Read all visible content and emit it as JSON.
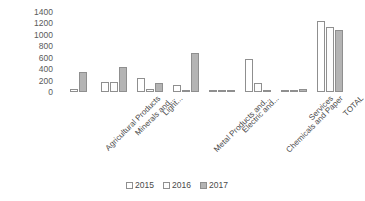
{
  "chart_data": {
    "type": "bar",
    "title": "",
    "subtitle": "",
    "xlabel": "",
    "ylabel": "",
    "ylim": [
      0,
      1400
    ],
    "ytick_step": 200,
    "yticks": [
      "1400",
      "1200",
      "1000",
      "800",
      "600",
      "400",
      "200",
      "0"
    ],
    "grid": false,
    "legend_position": "bottom",
    "categories": [
      "Agricultural Products",
      "Minerals and...",
      "Light...",
      "Metal Products and...",
      "Electric and...",
      "Chemicals and Paper",
      "Services",
      "TOTAL"
    ],
    "series": [
      {
        "name": "2015",
        "color": "#ffffff",
        "values": [
          50,
          180,
          250,
          130,
          5,
          570,
          25,
          1250
        ]
      },
      {
        "name": "2016",
        "color": "#fcfcfc",
        "values": [
          0,
          175,
          60,
          30,
          30,
          160,
          30,
          1140
        ]
      },
      {
        "name": "2017",
        "color": "#b4b4b4",
        "values": [
          350,
          440,
          150,
          690,
          10,
          25,
          60,
          1080
        ]
      }
    ]
  },
  "legend": {
    "items": [
      {
        "label": "2015"
      },
      {
        "label": "2016"
      },
      {
        "label": "2017"
      }
    ]
  }
}
